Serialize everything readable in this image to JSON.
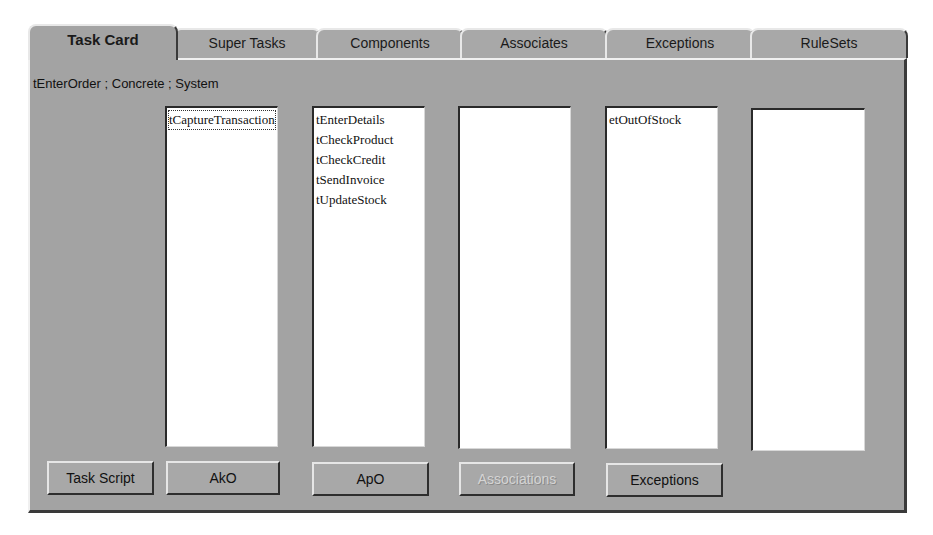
{
  "tabs": [
    {
      "label": "Task Card",
      "active": true
    },
    {
      "label": "Super Tasks",
      "active": false
    },
    {
      "label": "Components",
      "active": false
    },
    {
      "label": "Associates",
      "active": false
    },
    {
      "label": "Exceptions",
      "active": false
    },
    {
      "label": "RuleSets",
      "active": false
    }
  ],
  "header": {
    "path_label": "tEnterOrder ; Concrete ; System"
  },
  "lists": [
    {
      "items": [
        "tCaptureTransaction"
      ],
      "focused_index": 0
    },
    {
      "items": [
        "tEnterDetails",
        "tCheckProduct",
        "tCheckCredit",
        "tSendInvoice",
        "tUpdateStock"
      ]
    },
    {
      "items": []
    },
    {
      "items": [
        "etOutOfStock"
      ]
    },
    {
      "items": []
    }
  ],
  "buttons": {
    "task_script": "Task Script",
    "ako": "AkO",
    "apo": "ApO",
    "associations": "Associations",
    "exceptions": "Exceptions"
  },
  "colors": {
    "panel_bg": "#a3a3a3",
    "list_bg": "#ffffff",
    "disabled_text": "#d4d4d4"
  }
}
